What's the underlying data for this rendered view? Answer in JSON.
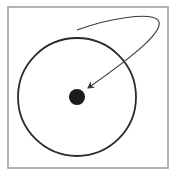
{
  "diagram": {
    "frame": {
      "x": 8,
      "y": 7,
      "width": 160,
      "height": 161,
      "stroke": "#9a9a9a"
    },
    "circle": {
      "cx": 77,
      "cy": 97,
      "r": 59,
      "stroke": "#2b2b2b"
    },
    "center_dot": {
      "cx": 77,
      "cy": 97,
      "r": 8,
      "fill": "#1a1a1a"
    },
    "arrow": {
      "path": "M 77 30 C 110 18, 150 12, 158 20 C 166 30, 135 55, 88 88",
      "stroke": "#3a3a3a",
      "head_tip": [
        86,
        90
      ]
    }
  }
}
